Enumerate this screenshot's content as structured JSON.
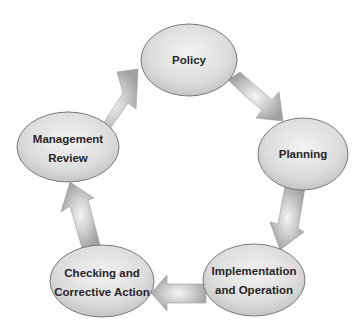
{
  "diagram": {
    "type": "cycle",
    "nodes": [
      {
        "id": "policy",
        "line1": "Policy",
        "line2": ""
      },
      {
        "id": "planning",
        "line1": "Planning",
        "line2": ""
      },
      {
        "id": "implementation",
        "line1": "Implementation",
        "line2": "and Operation"
      },
      {
        "id": "checking",
        "line1": "Checking and",
        "line2": "Corrective Action"
      },
      {
        "id": "management",
        "line1": "Management",
        "line2": "Review"
      }
    ],
    "edges": [
      {
        "from": "policy",
        "to": "planning"
      },
      {
        "from": "planning",
        "to": "implementation"
      },
      {
        "from": "implementation",
        "to": "checking"
      },
      {
        "from": "checking",
        "to": "management"
      },
      {
        "from": "management",
        "to": "policy"
      }
    ],
    "colors": {
      "node_fill_center": "#f0f0f0",
      "node_fill_edge": "#c6c6c6",
      "node_border": "#7a7a7a",
      "arrow_light": "#ececec",
      "arrow_dark": "#a4a4a4",
      "text": "#262626"
    }
  }
}
